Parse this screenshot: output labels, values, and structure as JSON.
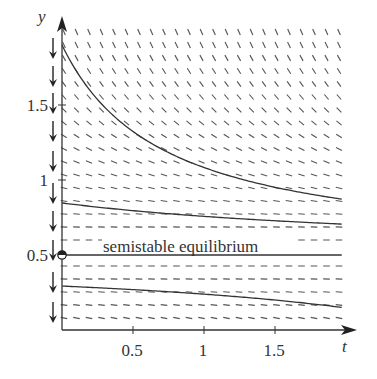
{
  "chart_data": {
    "type": "line",
    "subtype": "slope-field-with-phase-line",
    "title": "",
    "xlabel": "t",
    "ylabel": "y",
    "xlim": [
      0,
      1.95
    ],
    "ylim": [
      0,
      1.95
    ],
    "x_ticks": [
      0.5,
      1,
      1.5
    ],
    "x_tick_labels": [
      "0.5",
      "1",
      "1.5"
    ],
    "y_ticks": [
      0.5,
      1,
      1.5
    ],
    "y_tick_labels": [
      "0.5",
      "1",
      "1.5"
    ],
    "grid": false,
    "legend": null,
    "slope_field": {
      "description": "Short line segments with negative slope, steeper away from y = 0.5, horizontal near y = 0.5",
      "equation_shape": "dy/dt = -(y - 0.5)^2",
      "columns": 23,
      "rows": 23
    },
    "phase_line": {
      "position": "left of y-axis",
      "arrow_direction": "down",
      "arrow_count": 10
    },
    "equilibrium": {
      "y": 0.5,
      "type": "semistable",
      "marker": "half-filled circle at t = 0",
      "label": "semistable equilibrium"
    },
    "series": [
      {
        "name": "solution y0 = 1.9",
        "x": [
          0,
          0.25,
          0.5,
          0.75,
          1.0,
          1.25,
          1.5,
          1.75,
          1.95
        ],
        "values": [
          1.9,
          1.54,
          1.33,
          1.18,
          1.08,
          1.0,
          0.95,
          0.9,
          0.87
        ]
      },
      {
        "name": "solution y0 = 0.85",
        "x": [
          0,
          0.5,
          1.0,
          1.5,
          1.95
        ],
        "values": [
          0.85,
          0.8,
          0.77,
          0.74,
          0.71
        ]
      },
      {
        "name": "equilibrium y = 0.5",
        "x": [
          0,
          1.95
        ],
        "values": [
          0.5,
          0.5
        ]
      },
      {
        "name": "solution y0 = 0.29",
        "x": [
          0,
          0.5,
          1.0,
          1.5,
          1.95
        ],
        "values": [
          0.29,
          0.27,
          0.24,
          0.2,
          0.16
        ]
      }
    ]
  },
  "labels": {
    "y_axis": "y",
    "x_axis": "t",
    "annotation": "semistable equilibrium",
    "x_ticks": [
      "0.5",
      "1",
      "1.5"
    ],
    "y_ticks": [
      "1.5",
      "1",
      "0.5"
    ]
  }
}
